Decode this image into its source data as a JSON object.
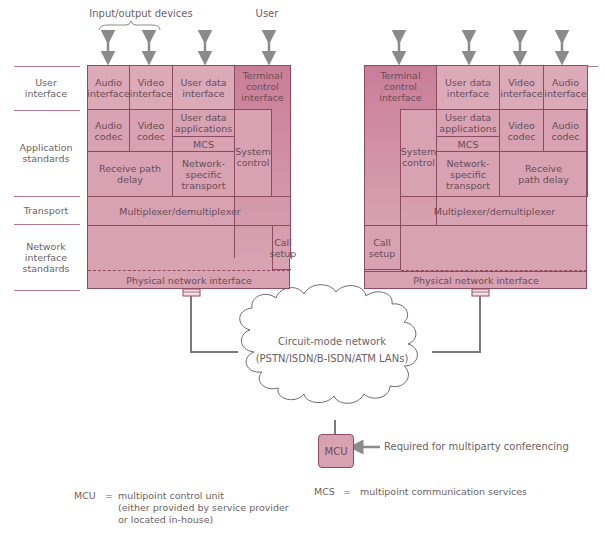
{
  "top_labels": {
    "io_devices": "Input/output devices",
    "user": "User"
  },
  "row_labels": [
    {
      "label": "User\ninterface"
    },
    {
      "label": "Application\nstandards"
    },
    {
      "label": "Transport"
    },
    {
      "label": "Network\ninterface\nstandards"
    }
  ],
  "left_stack": {
    "audio_interface": "Audio interface",
    "video_interface": "Video interface",
    "user_data_interface": "User data interface",
    "terminal_control_interface": "Terminal control interface",
    "audio_codec": "Audio codec",
    "video_codec": "Video codec",
    "user_data_applications": "User data applications",
    "mcs": "MCS",
    "system_control": "System control",
    "receive_path_delay": "Receive path delay",
    "network_specific_transport": "Network-specific transport",
    "multiplexer": "Multiplexer/demultiplexer",
    "call_setup": "Call setup",
    "physical_network_interface": "Physical network interface"
  },
  "right_stack": {
    "terminal_control_interface": "Terminal control interface",
    "user_data_interface": "User data interface",
    "video_interface": "Video interface",
    "audio_interface": "Audio interface",
    "system_control": "System control",
    "user_data_applications": "User data applications",
    "mcs": "MCS",
    "video_codec": "Video codec",
    "audio_codec": "Audio codec",
    "network_specific_transport": "Network-specific transport",
    "receive_path_delay": "Receive path delay",
    "multiplexer": "Multiplexer/demultiplexer",
    "call_setup": "Call setup",
    "physical_network_interface": "Physical network interface"
  },
  "network": {
    "line1": "Circuit-mode network",
    "line2": "(PSTN/ISDN/B-ISDN/ATM LANs)"
  },
  "mcu": {
    "label": "MCU",
    "note": "Required for multiparty conferencing"
  },
  "legend": {
    "mcu_abbr": "MCU",
    "mcu_eq": "=",
    "mcu_def1": "multipoint control unit",
    "mcu_def2": "(either provided by service provider",
    "mcu_def3": "or located in-house)",
    "mcs_abbr": "MCS",
    "mcs_eq": "=",
    "mcs_def": "multipoint communication services"
  },
  "colors": {
    "box_fill": "#d8a2b2",
    "box_border": "#8e4a62",
    "connector": "#7a7a7a",
    "text": "#6e5f66"
  }
}
